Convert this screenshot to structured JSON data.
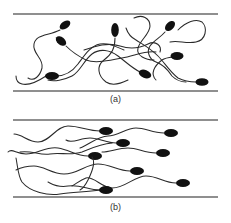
{
  "figure": {
    "panels": [
      {
        "id": "a",
        "label": "(a)",
        "state": "random orientation"
      },
      {
        "id": "b",
        "label": "(b)",
        "state": "aligned swimming"
      }
    ]
  },
  "colors": {
    "wall": "#6a6a6a",
    "tail": "#2a2a2a",
    "head": "#111111",
    "background": "#ffffff"
  }
}
